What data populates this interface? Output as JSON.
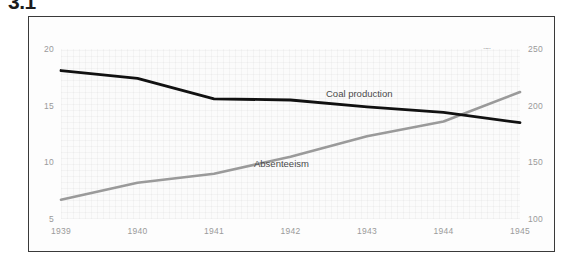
{
  "figure": {
    "number": "3.1"
  },
  "chart_data": {
    "type": "line",
    "title": "",
    "subtitle": "",
    "xlabel": "",
    "ylabel": "Percentage",
    "y2label": "Million tons",
    "grid": true,
    "legend_position": "inline-annotations",
    "categories": [
      "1939",
      "1940",
      "1941",
      "1942",
      "1943",
      "1944",
      "1945"
    ],
    "x": [
      1939,
      1940,
      1941,
      1942,
      1943,
      1944,
      1945
    ],
    "ylim": [
      5,
      20
    ],
    "yticks": [
      "20",
      "15",
      "10",
      "5"
    ],
    "ytick_values": [
      20,
      15,
      10,
      5
    ],
    "y2lim": [
      100,
      250
    ],
    "y2ticks": [
      "250",
      "200",
      "150",
      "100"
    ],
    "y2tick_values": [
      250,
      200,
      150,
      100
    ],
    "xticks": [
      "1939",
      "1940",
      "1941",
      "1942",
      "1943",
      "1944",
      "1945"
    ],
    "series": [
      {
        "name": "Coal production",
        "axis": "right",
        "unit": "Million tons",
        "color": "#111111",
        "values": [
          231,
          224,
          206,
          205,
          199,
          194,
          185
        ]
      },
      {
        "name": "Absenteeism",
        "axis": "left",
        "unit": "Percentage",
        "color": "#9a9a9a",
        "values": [
          6.7,
          8.2,
          9.0,
          10.5,
          12.3,
          13.6,
          16.2
        ]
      }
    ],
    "annotations": [
      {
        "text": "Coal production",
        "series": "Coal production"
      },
      {
        "text": "Absenteeism",
        "series": "Absenteeism"
      }
    ],
    "colors": {
      "coal_production": "#111111",
      "absenteeism": "#9a9a9a",
      "frame": "#3a3a3a",
      "tick_text": "#9a9a9a",
      "plot_background": "#fbfbfb"
    }
  }
}
